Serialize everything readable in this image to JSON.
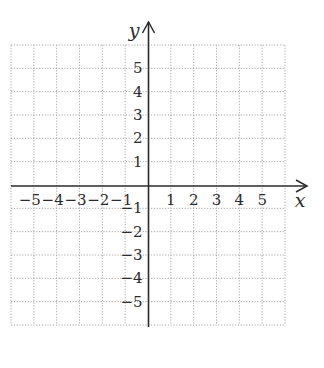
{
  "chart_data": {
    "type": "coordinate-grid",
    "title": "",
    "xlabel": "x",
    "ylabel": "y",
    "xlim": [
      -6,
      6
    ],
    "ylim": [
      -6,
      6
    ],
    "grid": true,
    "grid_style": "dotted",
    "x_ticks": [
      -5,
      -4,
      -3,
      -2,
      -1,
      1,
      2,
      3,
      4,
      5
    ],
    "y_ticks": [
      5,
      4,
      3,
      2,
      1,
      -1,
      -2,
      -3,
      -4,
      -5
    ],
    "x_tick_labels": [
      "−5",
      "−4",
      "−3",
      "−2",
      "−1",
      "1",
      "2",
      "3",
      "4",
      "5"
    ],
    "y_tick_labels": [
      "5",
      "4",
      "3",
      "2",
      "1",
      "−1",
      "−2",
      "−3",
      "−4",
      "−5"
    ],
    "series": []
  },
  "colors": {
    "axis": "#2b2b2b",
    "grid": "#a8a8a8",
    "background": "#ffffff"
  },
  "layout": {
    "grid_left": 11,
    "grid_right": 285,
    "grid_top": 45,
    "grid_bottom": 325,
    "origin_x": 148.5,
    "origin_y": 186,
    "x_axis_arrow_tip": 307,
    "y_axis_arrow_tip": 22
  }
}
